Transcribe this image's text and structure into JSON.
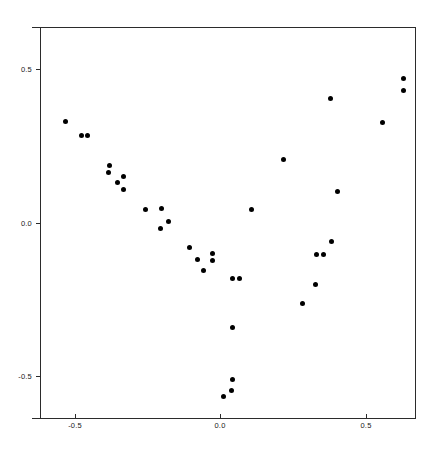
{
  "figure": {
    "width": 442,
    "height": 450,
    "background_color": "#ffffff",
    "axes_color": "#2b2b2b",
    "marker_color": "#000000"
  },
  "chart_data": {
    "type": "scatter",
    "title": "",
    "subtitle": "",
    "xlabel": "",
    "ylabel": "",
    "xlim": [
      -0.62,
      0.67
    ],
    "ylim": [
      -0.635,
      0.635
    ],
    "xticks": [
      -0.5,
      0.0,
      0.5
    ],
    "xticklabels": [
      "-0.5",
      "0.0",
      "0.5"
    ],
    "yticks": [
      -0.5,
      0.0,
      0.5
    ],
    "yticklabels": [
      "-0.5",
      "0.0",
      "0.5"
    ],
    "grid": false,
    "legend": null,
    "legend_position": null,
    "annotations": [],
    "marker": "filled-circle",
    "marker_size": 5,
    "n_points": 35,
    "series": [
      {
        "name": "points",
        "color": "#000000",
        "x": [
          -0.531,
          -0.476,
          -0.455,
          -0.38,
          -0.384,
          -0.332,
          -0.353,
          -0.332,
          -0.257,
          -0.202,
          -0.178,
          -0.205,
          -0.106,
          -0.079,
          -0.027,
          -0.027,
          -0.058,
          0.041,
          0.065,
          0.041,
          0.041,
          0.038,
          0.01,
          0.216,
          0.106,
          0.404,
          0.384,
          0.332,
          0.356,
          0.329,
          0.284,
          0.38,
          0.558,
          0.63,
          0.63
        ],
        "y": [
          0.328,
          0.283,
          0.283,
          0.185,
          0.162,
          0.149,
          0.13,
          0.107,
          0.042,
          0.045,
          0.003,
          -0.019,
          -0.081,
          -0.12,
          -0.101,
          -0.123,
          -0.156,
          -0.182,
          -0.182,
          -0.341,
          -0.51,
          -0.545,
          -0.565,
          0.205,
          0.042,
          0.101,
          -0.062,
          -0.104,
          -0.104,
          -0.201,
          -0.263,
          0.403,
          0.325,
          0.468,
          0.429
        ]
      }
    ]
  }
}
